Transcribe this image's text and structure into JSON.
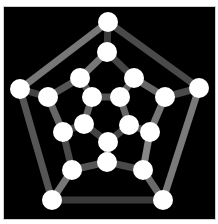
{
  "diagram": {
    "background": "#000000",
    "node_color": "#ffffff",
    "node_radius": 10,
    "edge_width": 7,
    "nodes": [
      {
        "id": "o0",
        "x": 108,
        "y": 22
      },
      {
        "id": "o1",
        "x": 199,
        "y": 88
      },
      {
        "id": "o2",
        "x": 163,
        "y": 200
      },
      {
        "id": "o3",
        "x": 52,
        "y": 200
      },
      {
        "id": "o4",
        "x": 20,
        "y": 89
      },
      {
        "id": "m0",
        "x": 107,
        "y": 52
      },
      {
        "id": "m1",
        "x": 80,
        "y": 78
      },
      {
        "id": "m2",
        "x": 134,
        "y": 78
      },
      {
        "id": "m3",
        "x": 48,
        "y": 97
      },
      {
        "id": "m4",
        "x": 165,
        "y": 97
      },
      {
        "id": "m5",
        "x": 63,
        "y": 132
      },
      {
        "id": "m6",
        "x": 150,
        "y": 132
      },
      {
        "id": "m7",
        "x": 72,
        "y": 170
      },
      {
        "id": "m8",
        "x": 107,
        "y": 162
      },
      {
        "id": "m9",
        "x": 143,
        "y": 170
      },
      {
        "id": "i0",
        "x": 92,
        "y": 97
      },
      {
        "id": "i1",
        "x": 120,
        "y": 97
      },
      {
        "id": "i2",
        "x": 84,
        "y": 124
      },
      {
        "id": "i3",
        "x": 129,
        "y": 125
      },
      {
        "id": "i4",
        "x": 108,
        "y": 142
      }
    ],
    "edges": [
      {
        "from": "o0",
        "to": "o1",
        "color": "#4a4a4a"
      },
      {
        "from": "o1",
        "to": "o2",
        "color": "#7a7a7a"
      },
      {
        "from": "o2",
        "to": "o3",
        "color": "#3a3a3a"
      },
      {
        "from": "o3",
        "to": "o4",
        "color": "#555555"
      },
      {
        "from": "o4",
        "to": "o0",
        "color": "#777777"
      },
      {
        "from": "o0",
        "to": "m0",
        "color": "#3c3c3c"
      },
      {
        "from": "o4",
        "to": "m3",
        "color": "#444444"
      },
      {
        "from": "o1",
        "to": "m4",
        "color": "#4a4a4a"
      },
      {
        "from": "o3",
        "to": "m7",
        "color": "#777777"
      },
      {
        "from": "o2",
        "to": "m9",
        "color": "#6a6a6a"
      },
      {
        "from": "m0",
        "to": "m1",
        "color": "#777777"
      },
      {
        "from": "m1",
        "to": "m3",
        "color": "#555555"
      },
      {
        "from": "m3",
        "to": "m5",
        "color": "#666666"
      },
      {
        "from": "m5",
        "to": "m7",
        "color": "#4a4a4a"
      },
      {
        "from": "m7",
        "to": "m8",
        "color": "#555555"
      },
      {
        "from": "m8",
        "to": "m9",
        "color": "#4a4a4a"
      },
      {
        "from": "m9",
        "to": "m6",
        "color": "#888888"
      },
      {
        "from": "m6",
        "to": "m4",
        "color": "#777777"
      },
      {
        "from": "m4",
        "to": "m2",
        "color": "#666666"
      },
      {
        "from": "m2",
        "to": "m0",
        "color": "#444444"
      },
      {
        "from": "m1",
        "to": "i0",
        "color": "#555555"
      },
      {
        "from": "m2",
        "to": "i1",
        "color": "#666666"
      },
      {
        "from": "m5",
        "to": "i2",
        "color": "#444444"
      },
      {
        "from": "m6",
        "to": "i3",
        "color": "#555555"
      },
      {
        "from": "m8",
        "to": "i4",
        "color": "#777777"
      },
      {
        "from": "i0",
        "to": "i1",
        "color": "#555555"
      },
      {
        "from": "i1",
        "to": "i3",
        "color": "#666666"
      },
      {
        "from": "i3",
        "to": "i4",
        "color": "#444444"
      },
      {
        "from": "i4",
        "to": "i2",
        "color": "#444444"
      },
      {
        "from": "i2",
        "to": "i0",
        "color": "#666666"
      }
    ]
  }
}
